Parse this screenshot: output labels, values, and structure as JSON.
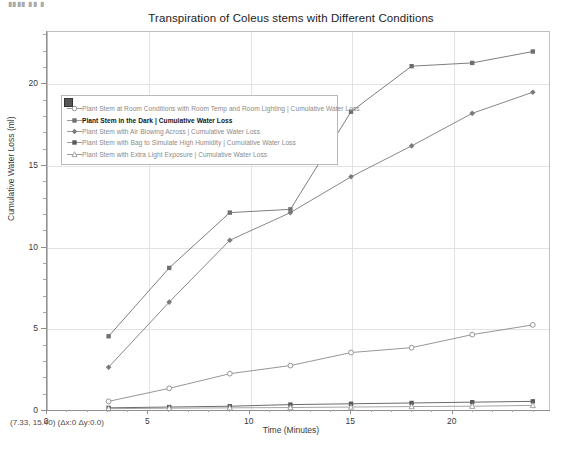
{
  "window": {
    "clipped_top_text": "▮▮▮▮ ▮▮ ▮"
  },
  "chart_data": {
    "type": "line",
    "title": "Transpiration of Coleus stems with Different Conditions",
    "xlabel": "Time (Minutes)",
    "ylabel": "Cumulative Water Loss (ml)",
    "x": [
      3,
      6,
      9,
      12,
      15,
      18,
      21,
      24
    ],
    "xlim": [
      0,
      24.8
    ],
    "ylim": [
      0,
      23.2
    ],
    "xticks": [
      0,
      5,
      10,
      15,
      20
    ],
    "yticks": [
      0,
      5,
      10,
      15,
      20
    ],
    "grid": true,
    "legend_position": "upper-left-inside",
    "series": [
      {
        "name": "Plant Stem at Room Conditions with Room Temp and Room Lighting | Cumulative Water Loss",
        "marker": "open-circle",
        "color": "#8a8a8a",
        "values": [
          0.5,
          1.3,
          2.2,
          2.7,
          3.5,
          3.8,
          4.6,
          5.2
        ]
      },
      {
        "name": "Plant Stem in the Dark | Cumulative Water Loss",
        "marker": "filled-square",
        "color": "#6f6f6f",
        "values": [
          4.5,
          8.7,
          12.1,
          12.3,
          18.3,
          21.1,
          21.3,
          22.0
        ]
      },
      {
        "name": "Plant Stem with Air Blowing Across | Cumulative Water Loss",
        "marker": "filled-diamond",
        "color": "#7a7a7a",
        "values": [
          2.6,
          6.6,
          10.4,
          12.1,
          14.3,
          16.2,
          18.2,
          19.5
        ]
      },
      {
        "name": "Plant Stem with Bag to Simulate High Humidity | Cumulative Water Loss",
        "marker": "filled-square",
        "color": "#5a5a5a",
        "values": [
          0.1,
          0.15,
          0.2,
          0.3,
          0.35,
          0.4,
          0.45,
          0.5
        ]
      },
      {
        "name": "Plant Stem with Extra Light Exposure | Cumulative Water Loss",
        "marker": "open-triangle",
        "color": "#9a9a9a",
        "values": [
          0.05,
          0.08,
          0.1,
          0.12,
          0.15,
          0.18,
          0.2,
          0.25
        ]
      }
    ]
  },
  "status": {
    "readout": "(7.33, 15.40) (Δx:0 Δy:0.0)"
  }
}
